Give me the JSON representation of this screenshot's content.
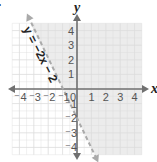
{
  "problem_label": ".",
  "chart_data": {
    "type": "line",
    "title": "",
    "xlabel": "x",
    "ylabel": "y",
    "xlim": [
      -4.5,
      4.5
    ],
    "ylim": [
      -4.5,
      4.5
    ],
    "grid": true,
    "x_ticks": [
      "⁻4",
      "⁻3",
      "⁻2",
      "⁻1",
      "0",
      "1",
      "2",
      "3",
      "4"
    ],
    "y_ticks": [
      "4",
      "3",
      "2",
      "1",
      "⁻1",
      "⁻2",
      "⁻3",
      "⁻4"
    ],
    "series": [
      {
        "name": "y = −2x − 2",
        "equation": "y = -2x - 2",
        "slope": -2,
        "intercept": -2,
        "style": "dashed",
        "points": [
          {
            "x": -3.25,
            "y": 4.5
          },
          {
            "x": -1,
            "y": 0
          },
          {
            "x": 0,
            "y": -2
          },
          {
            "x": 1.25,
            "y": -4.5
          }
        ]
      }
    ],
    "shaded_region": "y > -2x - 2 (right of / above the dashed line)",
    "annotations": [
      {
        "text": "y = −2x − 2",
        "position": "along line, upper left"
      }
    ],
    "colors": {
      "shade": "#ececec",
      "grid": "#dcdcdc",
      "axis": "#707070",
      "boundary": "#aaaaaa"
    }
  }
}
